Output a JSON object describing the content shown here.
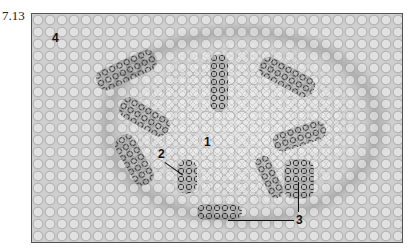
{
  "figure": {
    "number": "7.13",
    "labels": {
      "l1": "1",
      "l2": "2",
      "l3": "3",
      "l4": "4"
    }
  }
}
